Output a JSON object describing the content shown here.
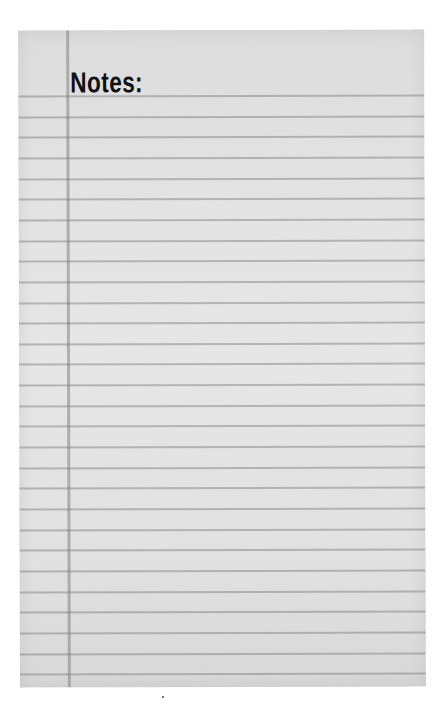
{
  "page": {
    "heading": "Notes:",
    "ruled_line_count": 29,
    "paper_color": "#e3e3e3",
    "rule_color": "#8a8a8a",
    "heading_color": "#111111"
  }
}
